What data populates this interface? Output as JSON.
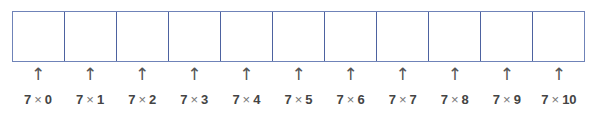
{
  "diagram": {
    "cells_count": 11,
    "border_color": "#4d62a0",
    "markers": [
      {
        "a": "7",
        "op": "×",
        "b": "0"
      },
      {
        "a": "7",
        "op": "×",
        "b": "1"
      },
      {
        "a": "7",
        "op": "×",
        "b": "2"
      },
      {
        "a": "7",
        "op": "×",
        "b": "3"
      },
      {
        "a": "7",
        "op": "×",
        "b": "4"
      },
      {
        "a": "7",
        "op": "×",
        "b": "5"
      },
      {
        "a": "7",
        "op": "×",
        "b": "6"
      },
      {
        "a": "7",
        "op": "×",
        "b": "7"
      },
      {
        "a": "7",
        "op": "×",
        "b": "8"
      },
      {
        "a": "7",
        "op": "×",
        "b": "9"
      },
      {
        "a": "7",
        "op": "×",
        "b": "10"
      }
    ],
    "arrow_glyph": "↑"
  }
}
